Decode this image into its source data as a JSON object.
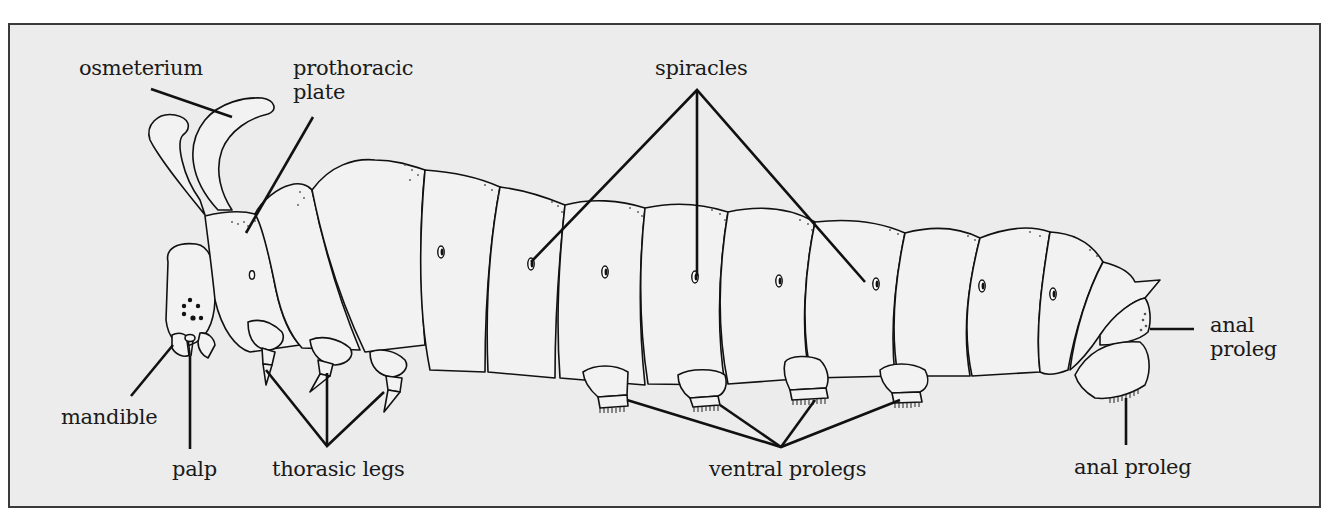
{
  "figure": {
    "colors": {
      "background": "#ececec",
      "frame": "#3a3a3a",
      "ink": "#111111"
    }
  },
  "labels": {
    "osmeterium": "osmeterium",
    "prothoracic_plate_line1": "prothoracic",
    "prothoracic_plate_line2": "plate",
    "spiracles": "spiracles",
    "mandible": "mandible",
    "palp": "palp",
    "thoracic_legs": "thorasic legs",
    "ventral_prolegs": "ventral prolegs",
    "anal_proleg_side_line1": "anal",
    "anal_proleg_side_line2": "proleg",
    "anal_proleg_bottom": "anal proleg"
  }
}
